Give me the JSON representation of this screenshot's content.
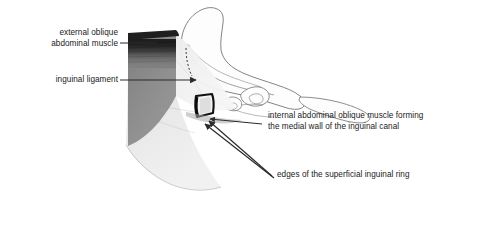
{
  "figure": {
    "kind": "anatomical-illustration",
    "background_color": "#ffffff",
    "ink_color": "#1a1a1a",
    "palette": {
      "muscle_dark_band": "#2a2a2a",
      "muscle_mid_gray": "#8c8c8c",
      "aponeurosis_light_gray": "#dedede",
      "aponeurosis_pale": "#ededed",
      "bone_outline": "#6e6e6e",
      "bone_fill": "#fdfdfd",
      "ring_outline": "#111111",
      "leader_line": "#2b2b2b"
    }
  },
  "labels": {
    "external_oblique": {
      "line1": "external oblique",
      "line2": "abdominal muscle"
    },
    "inguinal_ligament": {
      "line1": "inguinal ligament"
    },
    "internal_oblique": {
      "line1": "internal abdominal oblique muscle forming",
      "line2": "the medial wall of the inguinal canal"
    },
    "superficial_ring": {
      "line1": "edges of the superficial inguinal ring"
    }
  }
}
